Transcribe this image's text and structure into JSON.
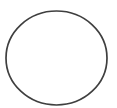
{
  "image": {
    "width": 117,
    "height": 108,
    "background_color": "#ffffff",
    "description": "hand-drawn circle outline",
    "alt_text": "A single thin dark-gray circle outline drawn on a plain white background"
  },
  "figure": {
    "shape_name": "circle",
    "stroke_color": "#3f3f3f",
    "stroke_width": 1.7,
    "fill_color": "none",
    "center_x": 56.5,
    "center_y": 58.0,
    "radius_x": 50.5,
    "radius_y": 47.0,
    "bounds": {
      "left": 6,
      "top": 11,
      "right": 107,
      "bottom": 105
    }
  }
}
